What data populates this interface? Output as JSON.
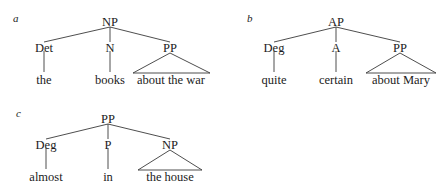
{
  "figure": {
    "background_color": "#ffffff",
    "line_color": "#3a3a3a",
    "text_color": "#1b1b1b"
  },
  "trees": [
    {
      "id": "a",
      "label": "a",
      "root": "NP",
      "children": [
        {
          "category": "Det",
          "word": "the",
          "triangle": false
        },
        {
          "category": "N",
          "word": "books",
          "triangle": false
        },
        {
          "category": "PP",
          "word": "about the war",
          "triangle": true
        }
      ]
    },
    {
      "id": "b",
      "label": "b",
      "root": "AP",
      "children": [
        {
          "category": "Deg",
          "word": "quite",
          "triangle": false
        },
        {
          "category": "A",
          "word": "certain",
          "triangle": false
        },
        {
          "category": "PP",
          "word": "about Mary",
          "triangle": true
        }
      ]
    },
    {
      "id": "c",
      "label": "c",
      "root": "PP",
      "children": [
        {
          "category": "Deg",
          "word": "almost",
          "triangle": false
        },
        {
          "category": "P",
          "word": "in",
          "triangle": false
        },
        {
          "category": "NP",
          "word": "the house",
          "triangle": true
        }
      ]
    }
  ]
}
